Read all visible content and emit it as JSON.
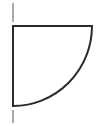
{
  "canvas": {
    "width": 98,
    "height": 126,
    "background_color": "#ffffff"
  },
  "figure": {
    "stroke_color": "#2b2b2b",
    "fill_color": "none",
    "main_stroke_width": 2,
    "tick_stroke_width": 1,
    "tick_color": "#555555"
  },
  "geometry": {
    "corner_x": 13,
    "corner_y": 26,
    "right_x": 92,
    "bottom_y": 106,
    "arc_radius_x": 79,
    "arc_radius_y": 80,
    "top_edge": {
      "x1": 13,
      "y1": 26,
      "x2": 92,
      "y2": 26
    },
    "left_edge": {
      "x1": 13,
      "y1": 26,
      "x2": 13,
      "y2": 106
    },
    "arc": {
      "start_x": 13,
      "start_y": 106,
      "end_x": 92,
      "end_y": 26,
      "sweep": "concave-toward-corner"
    },
    "tick_top": {
      "x1": 13,
      "y1": 3,
      "x2": 13,
      "y2": 22
    },
    "tick_bottom": {
      "x1": 13,
      "y1": 110,
      "x2": 13,
      "y2": 123
    }
  },
  "labels": {
    "has_text": false,
    "items": []
  }
}
